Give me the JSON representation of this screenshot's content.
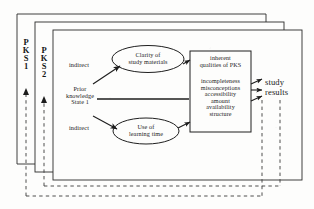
{
  "figure": {
    "type": "flow-diagram"
  },
  "layers": [
    {
      "name": "layer-outer",
      "label": "PKS 1",
      "letters": [
        "P",
        "K",
        "S",
        "1"
      ]
    },
    {
      "name": "layer-middle",
      "label": "PKS 2",
      "letters": [
        "P",
        "K",
        "S",
        "2"
      ]
    },
    {
      "name": "layer-inner",
      "label": "",
      "letters": []
    }
  ],
  "nodes": {
    "prior_knowledge": "Prior\nknowledge\nState 1",
    "clarity": "Clarity of\nstudy materials",
    "learning_time": "Use of\nlearning time",
    "qualities_header": "inherent\nqualities of PKS",
    "qualities_list": "incompleteness\nmisconceptions\naccessibility\namount\navailability\nstructure",
    "results": "study\nresults"
  },
  "edge_labels": {
    "indirect_upper": "indirect",
    "indirect_lower": "indirect"
  },
  "colors": {
    "ink": "#1a1a1a",
    "line": "#222222",
    "paper": "#fdfdfc",
    "dashed": "#3a3a3a"
  }
}
